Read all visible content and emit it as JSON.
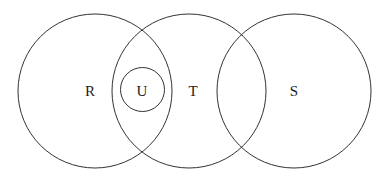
{
  "diagram": {
    "type": "venn",
    "circles": [
      {
        "label": "R",
        "cx": 95,
        "cy": 91,
        "r": 77
      },
      {
        "label": "T",
        "cx": 189,
        "cy": 91,
        "r": 77
      },
      {
        "label": "S",
        "cx": 294,
        "cy": 91,
        "r": 77
      },
      {
        "label": "U",
        "cx": 142.5,
        "cy": 89.5,
        "r": 22
      }
    ],
    "labels": {
      "R": "R",
      "T": "T",
      "S": "S",
      "U": "U"
    }
  }
}
